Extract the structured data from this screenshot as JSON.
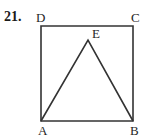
{
  "problem": {
    "number": "21."
  },
  "figure": {
    "stroke_color": "#333333",
    "background_color": "#ffffff",
    "square": {
      "name": "ABCD",
      "vertices": [
        {
          "label": "A",
          "x": 41,
          "y": 121,
          "corner": "bottom-left"
        },
        {
          "label": "B",
          "x": 133,
          "y": 121,
          "corner": "bottom-right"
        },
        {
          "label": "C",
          "x": 133,
          "y": 26,
          "corner": "top-right"
        },
        {
          "label": "D",
          "x": 41,
          "y": 26,
          "corner": "top-left"
        }
      ]
    },
    "triangle": {
      "name": "ABE",
      "apex": {
        "label": "E",
        "x": 88,
        "y": 40
      },
      "base": [
        "A",
        "B"
      ]
    },
    "labels": {
      "A": "A",
      "B": "B",
      "C": "C",
      "D": "D",
      "E": "E"
    }
  }
}
